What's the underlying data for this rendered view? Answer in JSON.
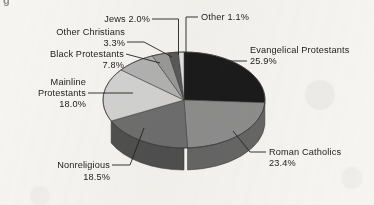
{
  "figure": {
    "corner_mark": "g",
    "background_color": "#f6f5f2"
  },
  "chart_data": {
    "type": "pie",
    "title": "",
    "subtitle": "",
    "xlabel": "",
    "ylabel": "",
    "legend_position": "callout-labels",
    "grid": false,
    "three_d": true,
    "start_angle_deg": 0,
    "direction": "clockwise",
    "categories": [
      "Evangelical Protestants",
      "Roman Catholics",
      "Nonreligious",
      "Mainline Protestants",
      "Black Protestants",
      "Other Christians",
      "Jews",
      "Other"
    ],
    "values": [
      25.9,
      23.4,
      18.5,
      18.0,
      7.8,
      3.3,
      2.0,
      1.1
    ],
    "value_labels": [
      "25.9%",
      "23.4%",
      "18.5%",
      "18.0%",
      "7.8%",
      "3.3%",
      "2.0%",
      "1.1%"
    ],
    "colors": [
      "#1b1b1b",
      "#8e8e8e",
      "#6f6f6f",
      "#d3d3d3",
      "#b3b3b3",
      "#9a9a9a",
      "#5a5a5a",
      "#e2e2e2"
    ],
    "units": "percent",
    "total": 100.0
  },
  "labels": {
    "evangelical": {
      "name": "Evangelical Protestants",
      "value": "25.9%"
    },
    "catholics": {
      "name": "Roman Catholics",
      "value": "23.4%"
    },
    "nonreligious": {
      "name": "Nonreligious",
      "value": "18.5%"
    },
    "mainline_line1": "Mainline",
    "mainline_line2": "Protestants",
    "mainline_value": "18.0%",
    "black_protestants": {
      "name": "Black Protestants",
      "value": "7.8%"
    },
    "other_christians": {
      "name": "Other Christians",
      "value": "3.3%"
    },
    "jews": "Jews 2.0%",
    "other": "Other 1.1%"
  }
}
